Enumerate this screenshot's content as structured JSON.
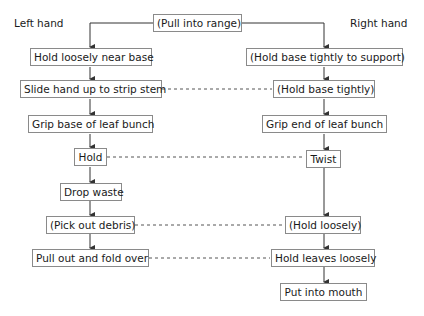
{
  "headers": {
    "left": "Left hand",
    "right": "Right hand"
  },
  "start": {
    "label": "(Pull into range)"
  },
  "left_steps": [
    {
      "label": "Hold loosely near base"
    },
    {
      "label": "Slide hand up to strip stem"
    },
    {
      "label": "Grip base of leaf bunch"
    },
    {
      "label": "Hold"
    },
    {
      "label": "Drop waste"
    },
    {
      "label": "(Pick out debris)"
    },
    {
      "label": "Pull out and fold over"
    }
  ],
  "right_steps": [
    {
      "label": "(Hold base tightly to support)"
    },
    {
      "label": "(Hold base tightly)"
    },
    {
      "label": "Grip end of leaf bunch"
    },
    {
      "label": "Twist"
    },
    {
      "label": "(Hold loosely)"
    },
    {
      "label": "Hold leaves loosely"
    },
    {
      "label": "Put into mouth"
    }
  ],
  "colors": {
    "line": "#333333",
    "box_border": "#8a8a8a",
    "text": "#1a1a1a"
  }
}
